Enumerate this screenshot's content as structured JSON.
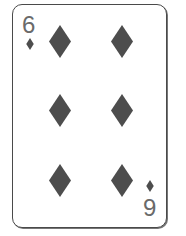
{
  "card": {
    "rank": "6",
    "rank_inverted_display": "9",
    "suit": "diamonds",
    "suit_icon": "diamond-icon",
    "pip_count": 6,
    "colors": {
      "pip": "#4d4d4d",
      "index_text": "#6a6a6a",
      "border": "#4a4a4a",
      "background": "#ffffff"
    }
  }
}
